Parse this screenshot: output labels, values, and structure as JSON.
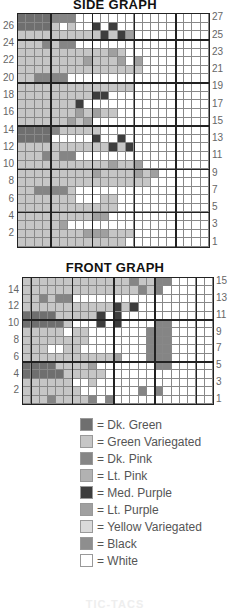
{
  "side_graph": {
    "title": "SIDE GRAPH",
    "columns": 23,
    "rows": 27,
    "col_groups": [
      4,
      5,
      5,
      5,
      4
    ],
    "row_groups": [
      3,
      5,
      5,
      5,
      5,
      4
    ],
    "left_labels": [
      "26",
      "24",
      "22",
      "20",
      "18",
      "16",
      "14",
      "12",
      "10",
      "8",
      "6",
      "4",
      "2"
    ],
    "right_labels": [
      "27",
      "25",
      "23",
      "21",
      "19",
      "17",
      "15",
      "13",
      "11",
      "9",
      "7",
      "5",
      "3",
      "1"
    ],
    "pattern": [
      "GGGGPPPWWWWWWWWWWWWWWWW",
      "GGGGVWVWWMWMWWWWWWWWWWW",
      "VVVVVVVVVVMVMUWWWWWWWWW",
      "VVVPVPPWWWWWWWWWWWWWWWW",
      "VVVVVVVVVVVUVWWWWWWWWWW",
      "VVVVVVVVUVVVUWUWWWWWWWW",
      "VVVVVVVVVVVVVVVWWWWWWWW",
      "VVPPPPWWWWWWWWWWWWWWWWW",
      "VVVVVVVVVVVVVVWWWWWWWWW",
      "VVVVVVVVVMMWWWWWWWWWWWW",
      "VVVVVVVMWWWWWWWWWWWWWWW",
      "VVVVVVVUVUVVWWWWWWWWWWW",
      "VVVVVVUVUWWWWWWWWWWWWWW",
      "GGGGPVVVVVWWWWWWWWWWWWW",
      "GGGGWWWWWMWWMWWWWWWWWWW",
      "VVVVVVVVVVVMVMWWWWWWWWW",
      "VVVPVPPWWWWWWWWWWWWWWWW",
      "VVVVVVVVVVVUVVUWWWWWWWW",
      "VVVVVVVVVUVVVVUVUWWWWWW",
      "VVVVVVVVVVVVVVVVWWWWWWW",
      "VVPPPPVWWWWWWWWWWWWWWWW",
      "VVVVVVVWWWVVWWWWWWWWWWW",
      "VVVVVVVVVVVVWWWWWWWWWWW",
      "VVVVVVVVVUUWWWWWWWWWWWW",
      "VVVVVUWWWWWWWWWWWWWWWWW",
      "VVVVVVVVUUUVVVWWWWWWWWW",
      "VVVVVVVVVVVVVWWWWWWWWWW"
    ]
  },
  "front_graph": {
    "title": "FRONT GRAPH",
    "columns": 23,
    "rows": 15,
    "col_groups": [
      1,
      5,
      5,
      5,
      5,
      2
    ],
    "row_groups": [
      5,
      5,
      5
    ],
    "left_labels": [
      "14",
      "12",
      "10",
      "8",
      "6",
      "4",
      "2"
    ],
    "right_labels": [
      "15",
      "13",
      "11",
      "9",
      "7",
      "5",
      "3",
      "1"
    ],
    "pattern": [
      "VVVVVVVVVVVVVPVVPPWWWWW",
      "VVVVVVVVVVVVVVPVPWWWWWW",
      "VVPVPPWWWWWWWWWWWWWWWWW",
      "VVVVVVVVVVVMVMWWWWWWWWW",
      "GGGGVVVVVMWMWWWWWWWWWWW",
      "GGGGGVWWWMWMWWWWPPWWWWW",
      "VVVVVWVVWWWWWWWPPPWWWWW",
      "VVVVVVVVWWWWWWWPPPWWWWW",
      "VVVWWVVWWWWWWWWPPPWWWWW",
      "VVVVVVVVVVVUWWWPPPWWWWW",
      "GGGGVVVVUWWWWWWWPPWWWWW",
      "GGGGGVVVVVWWWWWWWWWWWWW",
      "VVVVVVWWVWWWWWWWWWWWWWW",
      "VVVVVVVWWWWWWWPWPWWWWWW",
      "VVVPVVVVPWPWWWWWWWWWWWW"
    ]
  },
  "legend": [
    {
      "code": "G",
      "label": "= Dk. Green",
      "color": "#6f6f6f"
    },
    {
      "code": "V",
      "label": "= Green Variegated",
      "color": "#c6c6c6"
    },
    {
      "code": "P",
      "label": "= Dk. Pink",
      "color": "#858585"
    },
    {
      "code": "L",
      "label": "= Lt. Pink",
      "color": "#b2b2b2"
    },
    {
      "code": "M",
      "label": "= Med. Purple",
      "color": "#3d3d3d"
    },
    {
      "code": "U",
      "label": "= Lt. Purple",
      "color": "#a0a0a0"
    },
    {
      "code": "Y",
      "label": "= Yellow Variegated",
      "color": "#dadada"
    },
    {
      "code": "K",
      "label": "= Black",
      "color": "#8e8e8e"
    },
    {
      "code": "W",
      "label": "= White",
      "color": "#ffffff"
    }
  ],
  "footer": {
    "text": "TIC-TACS"
  }
}
